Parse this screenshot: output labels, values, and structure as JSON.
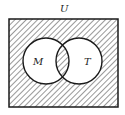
{
  "diagram": {
    "type": "venn",
    "universe_label": "U",
    "sets": [
      {
        "label": "M"
      },
      {
        "label": "T"
      }
    ],
    "shaded_regions": [
      "outside M and T (within U)",
      "M ∩ T"
    ],
    "unshaded_regions": [
      "M only",
      "T only"
    ],
    "colors": {
      "stroke": "#1a1a1a",
      "hatch": "#333333",
      "background": "#ffffff"
    }
  }
}
